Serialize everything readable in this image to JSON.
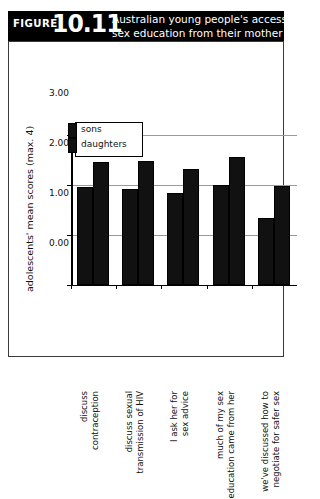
{
  "figure": {
    "label": "FIGURE",
    "number": "10.11",
    "title_line1": "Australian young people's access to",
    "title_line2": "sex education from their mother",
    "banner_color": "#000000",
    "frame_color": "#3a3a3a"
  },
  "legend": {
    "position": "top-left-inside-plot",
    "entries": [
      {
        "label": "sons",
        "color": "#111111"
      },
      {
        "label": "daughters",
        "color": "#111111"
      }
    ]
  },
  "chart_data": {
    "type": "bar",
    "title": "Australian young people's access to sex education from their mother",
    "xlabel": "",
    "ylabel": "adolescents' mean scores (max. 4)",
    "ylim": [
      0,
      3
    ],
    "yticks": [
      "0.00",
      "1.00",
      "2.00",
      "3.00"
    ],
    "ytick_values": [
      0,
      1,
      2,
      3
    ],
    "grid": true,
    "legend_position": "upper left",
    "categories": [
      "discuss contraception",
      "discuss sexual transmission of HIV",
      "I ask her for sex advice",
      "much of my sex education came from her",
      "we've discussed how to negotiate for safer sex"
    ],
    "category_lines": [
      [
        "discuss",
        "contraception"
      ],
      [
        "discuss sexual",
        "transmission of HIV"
      ],
      [
        "I ask her for",
        "sex advice"
      ],
      [
        "much of my sex",
        "education came from her"
      ],
      [
        "we've discussed how to",
        "negotiate for safer sex"
      ]
    ],
    "series": [
      {
        "name": "sons",
        "color": "#111111",
        "values": [
          1.97,
          1.92,
          1.85,
          2.0,
          1.35
        ]
      },
      {
        "name": "daughters",
        "color": "#111111",
        "values": [
          2.47,
          2.48,
          2.32,
          2.57,
          1.98
        ]
      }
    ]
  }
}
